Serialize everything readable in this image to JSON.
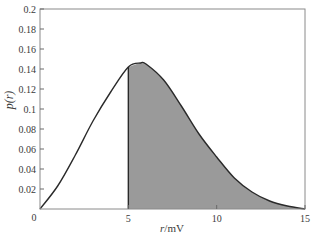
{
  "chart_data": {
    "type": "area",
    "title": "",
    "xlabel": "r/mV",
    "ylabel": "p(r)",
    "xlim": [
      0,
      15
    ],
    "ylim": [
      0,
      0.2
    ],
    "grid": false,
    "legend": null,
    "x_ticks": [
      0,
      5,
      10,
      15
    ],
    "x_tick_labels": [
      "0",
      "5",
      "10",
      "15"
    ],
    "y_ticks": [
      0.02,
      0.04,
      0.06,
      0.08,
      0.1,
      0.12,
      0.14,
      0.16,
      0.18,
      0.2
    ],
    "y_tick_labels": [
      "0.02",
      "0.04",
      "0.06",
      "0.08",
      "0.1",
      "0.12",
      "0.14",
      "0.16",
      "0.18",
      "0.2"
    ],
    "series": [
      {
        "name": "p(r)",
        "x": [
          0,
          1,
          2,
          3,
          4,
          5,
          5.7,
          6,
          7,
          8,
          9,
          10,
          11,
          12,
          13,
          14,
          15
        ],
        "values": [
          0,
          0.023,
          0.054,
          0.088,
          0.117,
          0.142,
          0.146,
          0.145,
          0.129,
          0.103,
          0.075,
          0.052,
          0.031,
          0.017,
          0.008,
          0.003,
          0
        ]
      }
    ],
    "shaded_region": {
      "from_x": 5,
      "to_x": 15,
      "color": "#9a9a9a"
    },
    "colors": {
      "curve": "#2a2a2a",
      "frame": "#8a8a8a",
      "fill": "#9a9a9a"
    }
  }
}
